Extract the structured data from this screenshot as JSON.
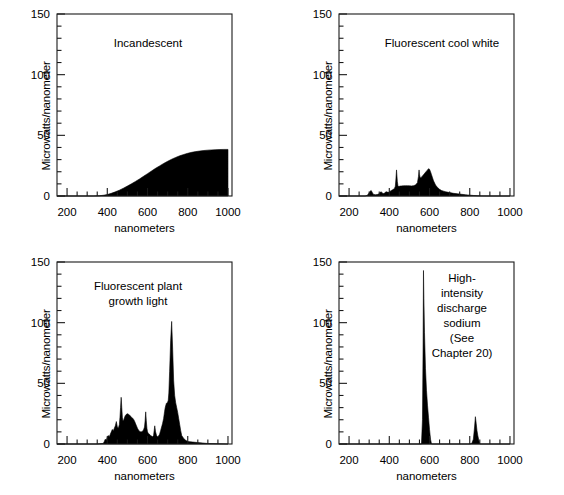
{
  "figure": {
    "title": "",
    "panels": [
      {
        "id": "incandescent",
        "title": "Incandescent",
        "title_x": 148,
        "title_y": 47,
        "xlabel": "nanometers",
        "ylabel": "Microwatts/nanometer",
        "xticks": [
          200,
          400,
          600,
          800,
          1000
        ],
        "yticks": [
          0,
          50,
          100,
          150
        ],
        "xlim": [
          150,
          1020
        ],
        "ylim": [
          0,
          150
        ]
      },
      {
        "id": "fluorescent-cool-white",
        "title": "Fluorescent cool white",
        "title_x": 160,
        "title_y": 47,
        "xlabel": "nanometers",
        "ylabel": "Microwatts/nanometer",
        "xticks": [
          200,
          400,
          600,
          800,
          1000
        ],
        "yticks": [
          0,
          50,
          100,
          150
        ],
        "xlim": [
          150,
          1020
        ],
        "ylim": [
          0,
          150
        ]
      },
      {
        "id": "fluorescent-plant-growth-light",
        "title": "Fluorescent plant\ngrowth light",
        "title_x": 138,
        "title_y": 42,
        "xlabel": "nanometers",
        "ylabel": "Microwatts/nanometer",
        "xticks": [
          200,
          400,
          600,
          800,
          1000
        ],
        "yticks": [
          0,
          50,
          100,
          150
        ],
        "xlim": [
          150,
          1020
        ],
        "ylim": [
          0,
          150
        ]
      },
      {
        "id": "high-intensity-discharge-sodium",
        "title": "High-\nintensity\ndischarge\nsodium\n(See\nChapter 20)",
        "title_x": 180,
        "title_y": 34,
        "xlabel": "nanometers",
        "ylabel": "Microwatts/nanometer",
        "xticks": [
          200,
          400,
          600,
          800,
          1000
        ],
        "yticks": [
          0,
          50,
          100,
          150
        ],
        "xlim": [
          150,
          1020
        ],
        "ylim": [
          0,
          150
        ]
      }
    ]
  },
  "chart_data": [
    {
      "type": "area",
      "title": "Incandescent",
      "xlabel": "nanometers",
      "ylabel": "Microwatts/nanometer",
      "xlim": [
        150,
        1020
      ],
      "ylim": [
        0,
        150
      ],
      "xticks": [
        200,
        400,
        600,
        800,
        1000
      ],
      "yticks": [
        0,
        50,
        100,
        150
      ],
      "grid": false,
      "legend": null,
      "x": [
        150,
        200,
        250,
        300,
        330,
        360,
        380,
        400,
        420,
        440,
        460,
        480,
        500,
        520,
        540,
        560,
        580,
        600,
        620,
        640,
        660,
        680,
        700,
        720,
        740,
        760,
        780,
        800,
        820,
        840,
        860,
        880,
        900,
        920,
        940,
        960,
        980,
        1000
      ],
      "values": [
        0,
        0,
        0,
        0,
        0,
        0.2,
        0.6,
        1.2,
        2.2,
        3.4,
        4.8,
        6.4,
        8.2,
        10.0,
        12.0,
        14.0,
        16.2,
        18.4,
        20.6,
        22.8,
        24.8,
        26.8,
        28.6,
        30.3,
        31.8,
        33.1,
        34.2,
        35.2,
        36.0,
        36.6,
        37.1,
        37.5,
        37.8,
        38.0,
        38.2,
        38.3,
        38.4,
        38.4
      ]
    },
    {
      "type": "area",
      "title": "Fluorescent cool white",
      "xlabel": "nanometers",
      "ylabel": "Microwatts/nanometer",
      "xlim": [
        150,
        1020
      ],
      "ylim": [
        0,
        150
      ],
      "xticks": [
        200,
        400,
        600,
        800,
        1000
      ],
      "yticks": [
        0,
        50,
        100,
        150
      ],
      "grid": false,
      "legend": null,
      "x": [
        150,
        200,
        250,
        280,
        290,
        300,
        305,
        310,
        315,
        320,
        330,
        340,
        350,
        355,
        360,
        365,
        370,
        375,
        380,
        385,
        390,
        395,
        400,
        405,
        410,
        415,
        420,
        425,
        430,
        433,
        436,
        440,
        443,
        446,
        450,
        455,
        460,
        470,
        480,
        490,
        500,
        510,
        520,
        530,
        540,
        545,
        548,
        550,
        553,
        556,
        560,
        565,
        570,
        575,
        580,
        585,
        590,
        595,
        600,
        605,
        610,
        615,
        620,
        630,
        640,
        650,
        660,
        670,
        680,
        700,
        720,
        740,
        760,
        780,
        800,
        820,
        840,
        860,
        900,
        950,
        1000
      ],
      "values": [
        0,
        0,
        0,
        0,
        0.5,
        2.5,
        4.0,
        4.5,
        3.0,
        1.5,
        1.0,
        1.2,
        1.8,
        3.0,
        3.5,
        2.5,
        2.0,
        2.2,
        3.0,
        3.5,
        3.2,
        3.0,
        3.4,
        4.0,
        4.5,
        5.0,
        5.5,
        6.0,
        8.0,
        14.0,
        21.5,
        12.0,
        8.5,
        8.0,
        8.0,
        8.2,
        8.3,
        8.4,
        8.5,
        8.5,
        8.4,
        8.3,
        8.5,
        9.0,
        11.0,
        16.0,
        21.5,
        18.0,
        15.5,
        15.0,
        15.5,
        16.5,
        17.5,
        18.5,
        19.5,
        20.5,
        21.5,
        22.5,
        22.0,
        20.0,
        17.5,
        15.0,
        12.5,
        9.0,
        7.0,
        5.5,
        4.5,
        4.0,
        3.5,
        2.8,
        2.2,
        1.8,
        1.4,
        1.0,
        0.7,
        0.4,
        0.2,
        0.1,
        0,
        0,
        0
      ]
    },
    {
      "type": "area",
      "title": "Fluorescent plant growth light",
      "xlabel": "nanometers",
      "ylabel": "Microwatts/nanometer",
      "xlim": [
        150,
        1020
      ],
      "ylim": [
        0,
        150
      ],
      "xticks": [
        200,
        400,
        600,
        800,
        1000
      ],
      "yticks": [
        0,
        50,
        100,
        150
      ],
      "grid": false,
      "legend": null,
      "x": [
        150,
        300,
        350,
        380,
        385,
        390,
        395,
        400,
        405,
        410,
        415,
        420,
        425,
        430,
        435,
        440,
        445,
        450,
        455,
        460,
        463,
        466,
        469,
        472,
        475,
        478,
        482,
        486,
        490,
        495,
        500,
        505,
        510,
        515,
        520,
        525,
        530,
        535,
        540,
        545,
        550,
        555,
        560,
        565,
        570,
        575,
        580,
        585,
        588,
        591,
        594,
        597,
        600,
        603,
        606,
        610,
        615,
        620,
        625,
        630,
        633,
        636,
        640,
        645,
        650,
        655,
        660,
        665,
        670,
        675,
        680,
        685,
        688,
        691,
        694,
        697,
        700,
        703,
        706,
        710,
        715,
        720,
        725,
        730,
        735,
        740,
        745,
        750,
        755,
        760,
        765,
        770,
        780,
        790,
        800,
        850,
        900,
        1000
      ],
      "values": [
        0,
        0,
        0,
        0.5,
        2.0,
        4.0,
        3.0,
        5.5,
        7.0,
        6.0,
        8.0,
        10.0,
        12.0,
        11.0,
        13.0,
        15.0,
        18.5,
        14.0,
        13.0,
        16.0,
        22.0,
        30.0,
        38.5,
        30.0,
        22.0,
        19.0,
        20.0,
        22.0,
        23.5,
        24.5,
        25.0,
        24.5,
        24.0,
        23.0,
        22.0,
        21.5,
        20.5,
        19.0,
        17.0,
        15.0,
        13.0,
        11.5,
        10.5,
        10.0,
        10.0,
        10.5,
        11.5,
        14.0,
        19.0,
        26.5,
        19.0,
        13.0,
        10.0,
        9.0,
        8.5,
        8.0,
        7.0,
        6.5,
        6.0,
        7.0,
        11.0,
        15.0,
        10.0,
        7.0,
        6.0,
        6.5,
        8.0,
        11.0,
        14.0,
        17.0,
        21.0,
        27.0,
        30.0,
        32.0,
        33.5,
        34.0,
        34.5,
        36.0,
        42.0,
        60.0,
        85.0,
        101.0,
        78.0,
        52.0,
        40.0,
        34.0,
        30.0,
        26.0,
        21.0,
        16.0,
        11.0,
        7.0,
        4.5,
        3.0,
        2.0,
        1.2,
        0.4,
        0,
        0,
        0
      ]
    },
    {
      "type": "area",
      "title": "High-intensity discharge sodium",
      "xlabel": "nanometers",
      "ylabel": "Microwatts/nanometer",
      "xlim": [
        150,
        1020
      ],
      "ylim": [
        0,
        150
      ],
      "xticks": [
        200,
        400,
        600,
        800,
        1000
      ],
      "yticks": [
        0,
        50,
        100,
        150
      ],
      "grid": false,
      "legend": null,
      "x": [
        150,
        400,
        500,
        550,
        560,
        565,
        568,
        570,
        572,
        575,
        580,
        585,
        590,
        595,
        600,
        605,
        610,
        650,
        700,
        760,
        790,
        800,
        810,
        818,
        824,
        828,
        832,
        836,
        840,
        845,
        850,
        900,
        1000
      ],
      "values": [
        0,
        0,
        0,
        0,
        0,
        20.0,
        80.0,
        143.0,
        120.0,
        92.0,
        62.0,
        44.0,
        32.0,
        22.0,
        12.0,
        4.0,
        0,
        0,
        0,
        0,
        0,
        0,
        0.5,
        4.0,
        14.0,
        22.5,
        17.0,
        11.0,
        7.0,
        3.0,
        0,
        0,
        0
      ]
    }
  ]
}
